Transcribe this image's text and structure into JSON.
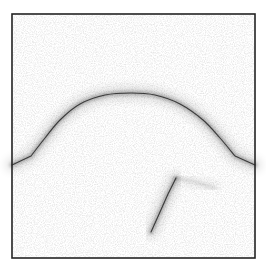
{
  "chart_data": {
    "type": "scatter",
    "title": "",
    "xlabel": "",
    "ylabel": "",
    "grid": false,
    "legend": null,
    "frame": {
      "left": 12,
      "top": 14,
      "right": 255,
      "bottom": 258,
      "color": "#222222"
    },
    "background_noise": {
      "color": "#d9d9d9",
      "density": "light"
    },
    "series": [
      {
        "name": "arch-curve",
        "description": "dense scatter forming a piecewise curve: short rising segment from left edge, large arch, short descending segment to right edge",
        "points_px": [
          [
            12,
            165
          ],
          [
            31,
            156
          ],
          [
            45,
            138
          ],
          [
            60,
            120
          ],
          [
            80,
            104
          ],
          [
            105,
            95
          ],
          [
            131,
            93
          ],
          [
            155,
            95
          ],
          [
            180,
            104
          ],
          [
            203,
            120
          ],
          [
            220,
            138
          ],
          [
            235,
            156
          ],
          [
            255,
            165
          ]
        ],
        "color": "#3a3a3a"
      },
      {
        "name": "lower-branch",
        "description": "dense scatter line rising from bottom-center toward the arch interior, with a faint continuation",
        "points_px": [
          [
            151,
            232
          ],
          [
            160,
            212
          ],
          [
            168,
            194
          ],
          [
            176,
            178
          ]
        ],
        "faint_continuation_px": [
          [
            176,
            178
          ],
          [
            195,
            182
          ],
          [
            215,
            188
          ]
        ],
        "color": "#3a3a3a"
      }
    ]
  },
  "labels": {
    "figure": "scatter density plot"
  }
}
